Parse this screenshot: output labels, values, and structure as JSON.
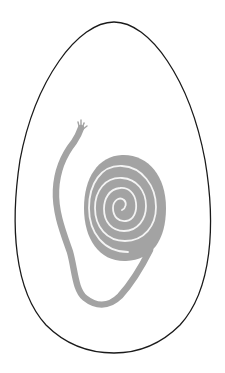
{
  "illustration": {
    "subject": "egg outline containing a coiled spiral with a trailing frayed tail",
    "colors": {
      "background": "#ffffff",
      "outline": "#1a1a1a",
      "coil": "#a3a3a3",
      "coil_gap": "#f4f4f4"
    },
    "elements": [
      {
        "name": "egg-outline",
        "shape": "egg",
        "bounds": {
          "x": 15,
          "y": 22,
          "w": 198,
          "h": 331
        }
      },
      {
        "name": "spiral-coil",
        "turns": 6,
        "center": {
          "x": 122,
          "y": 210
        }
      },
      {
        "name": "coil-tail",
        "description": "tail leaving the spiral, looping down and up the left side"
      },
      {
        "name": "frayed-tip",
        "position": {
          "x": 80,
          "y": 125
        }
      }
    ]
  }
}
